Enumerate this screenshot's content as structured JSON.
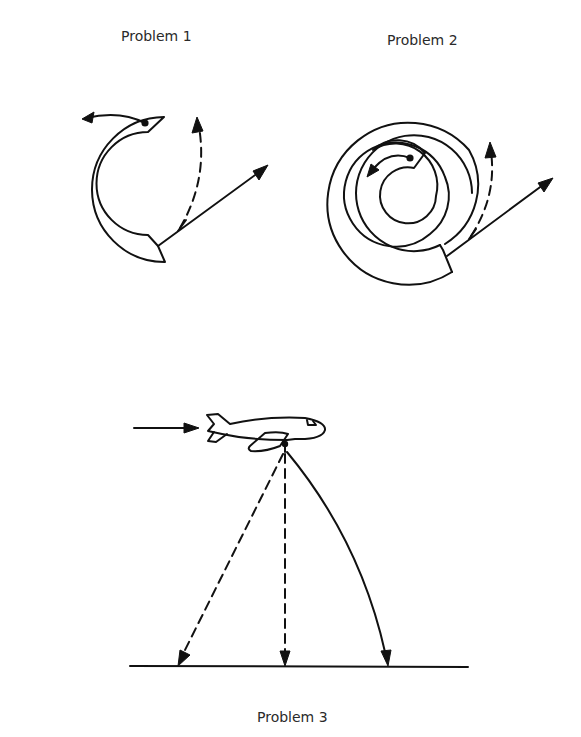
{
  "figure": {
    "panels": [
      {
        "id": "problem-1",
        "label": "Problem 1",
        "shape": "C-shaped curved tube (open ring)",
        "elements": [
          "ball-at-tube-entrance",
          "solid-arrow-along-tube-path",
          "dashed-curved-exit-path",
          "solid-straight-exit-path"
        ]
      },
      {
        "id": "problem-2",
        "label": "Problem 2",
        "shape": "spiral tube",
        "elements": [
          "ball-at-spiral-center",
          "solid-arrow-along-spiral-path",
          "dashed-curved-exit-path",
          "solid-straight-exit-path"
        ]
      },
      {
        "id": "problem-3",
        "label": "Problem 3",
        "shape": "airplane dropping object over ground",
        "elements": [
          "flight-direction-arrow",
          "airplane",
          "dashed-backward-slanting-path",
          "dashed-vertical-path",
          "solid-forward-curved-path",
          "ground-line"
        ]
      }
    ]
  }
}
